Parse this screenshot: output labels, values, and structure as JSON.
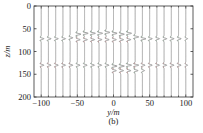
{
  "chart_data": {
    "type": "line",
    "subtype": "seismic-wiggle",
    "title": "",
    "caption": "(b)",
    "xlabel": "y/m",
    "ylabel": "z/m",
    "xlim": [
      -110,
      110
    ],
    "ylim": [
      200,
      0
    ],
    "y_inverted": true,
    "grid": false,
    "x_ticks": [
      -100,
      -50,
      0,
      50,
      100
    ],
    "x_tick_labels": [
      "−100",
      "−50",
      "0",
      "50",
      "100"
    ],
    "y_ticks": [
      0,
      50,
      100,
      150,
      200
    ],
    "y_tick_labels": [
      "0",
      "50",
      "100",
      "150",
      "200"
    ],
    "trace_positions": [
      -100,
      -90,
      -80,
      -70,
      -60,
      -50,
      -40,
      -30,
      -20,
      -10,
      0,
      10,
      20,
      30,
      40,
      50,
      60,
      70,
      80,
      90,
      100
    ],
    "events": [
      {
        "name": "upper-reflection",
        "z_by_trace": [
          72,
          72,
          72,
          72,
          70,
          62,
          60,
          60,
          60,
          58,
          60,
          62,
          60,
          68,
          72,
          72,
          72,
          72,
          72,
          72,
          72
        ],
        "z_secondary_by_trace": [
          null,
          null,
          null,
          null,
          null,
          74,
          74,
          74,
          74,
          74,
          74,
          74,
          74,
          null,
          null,
          null,
          null,
          null,
          null,
          null,
          null
        ],
        "amplitude_by_trace": [
          3,
          3,
          3,
          3,
          3,
          4,
          4,
          4,
          4,
          4,
          4,
          4,
          4,
          4,
          4,
          3,
          3,
          3,
          3,
          3,
          2
        ]
      },
      {
        "name": "lower-reflection",
        "z_by_trace": [
          130,
          130,
          130,
          130,
          130,
          130,
          130,
          130,
          130,
          130,
          132,
          132,
          130,
          130,
          130,
          130,
          130,
          130,
          130,
          130,
          130
        ],
        "z_secondary_by_trace": [
          null,
          null,
          null,
          null,
          null,
          null,
          null,
          null,
          null,
          null,
          142,
          142,
          142,
          142,
          142,
          null,
          null,
          null,
          null,
          null,
          null
        ],
        "amplitude_by_trace": [
          3,
          3,
          3,
          3,
          3,
          3,
          3,
          3,
          3,
          3,
          4,
          4,
          4,
          4,
          3,
          3,
          3,
          3,
          3,
          3,
          2
        ]
      }
    ],
    "colors": {
      "trace": "#8a8a8a",
      "wavelet_fill_a": "#6f9e7a",
      "wavelet_fill_b": "#c06060",
      "axis": "#333333"
    }
  }
}
